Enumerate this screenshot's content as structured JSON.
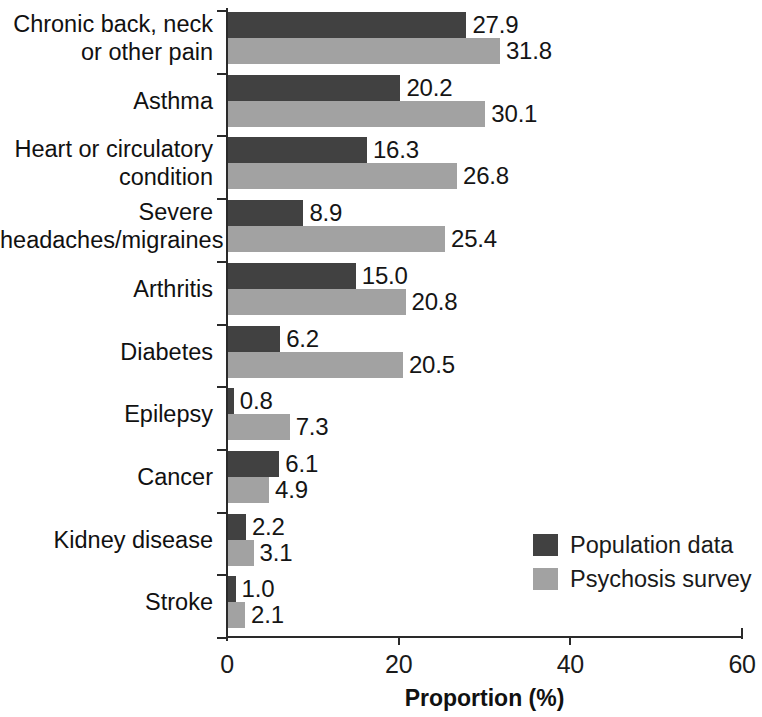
{
  "chart_data": {
    "type": "bar",
    "orientation": "horizontal",
    "title": "",
    "xlabel": "Proportion (%)",
    "ylabel": "",
    "xlim": [
      0,
      60
    ],
    "xticks": [
      "0",
      "20",
      "40",
      "60"
    ],
    "grid": false,
    "legend_position": "bottom-right",
    "categories": [
      "Chronic back, neck\nor other pain",
      "Asthma",
      "Heart or circulatory\ncondition",
      "Severe\nheadaches/migraines",
      "Arthritis",
      "Diabetes",
      "Epilepsy",
      "Cancer",
      "Kidney disease",
      "Stroke"
    ],
    "series": [
      {
        "name": "Population data",
        "color": "#414141",
        "values": [
          27.9,
          20.2,
          16.3,
          8.9,
          15.0,
          6.2,
          0.8,
          6.1,
          2.2,
          1.0
        ],
        "labels": [
          "27.9",
          "20.2",
          "16.3",
          "8.9",
          "15.0",
          "6.2",
          "0.8",
          "6.1",
          "2.2",
          "1.0"
        ]
      },
      {
        "name": "Psychosis survey",
        "color": "#a2a2a2",
        "values": [
          31.8,
          30.1,
          26.8,
          25.4,
          20.8,
          20.5,
          7.3,
          4.9,
          3.1,
          2.1
        ],
        "labels": [
          "31.8",
          "30.1",
          "26.8",
          "25.4",
          "20.8",
          "20.5",
          "7.3",
          "4.9",
          "3.1",
          "2.1"
        ]
      }
    ]
  },
  "legend": {
    "items": [
      {
        "label": "Population data",
        "color": "#414141"
      },
      {
        "label": "Psychosis survey",
        "color": "#a2a2a2"
      }
    ]
  }
}
